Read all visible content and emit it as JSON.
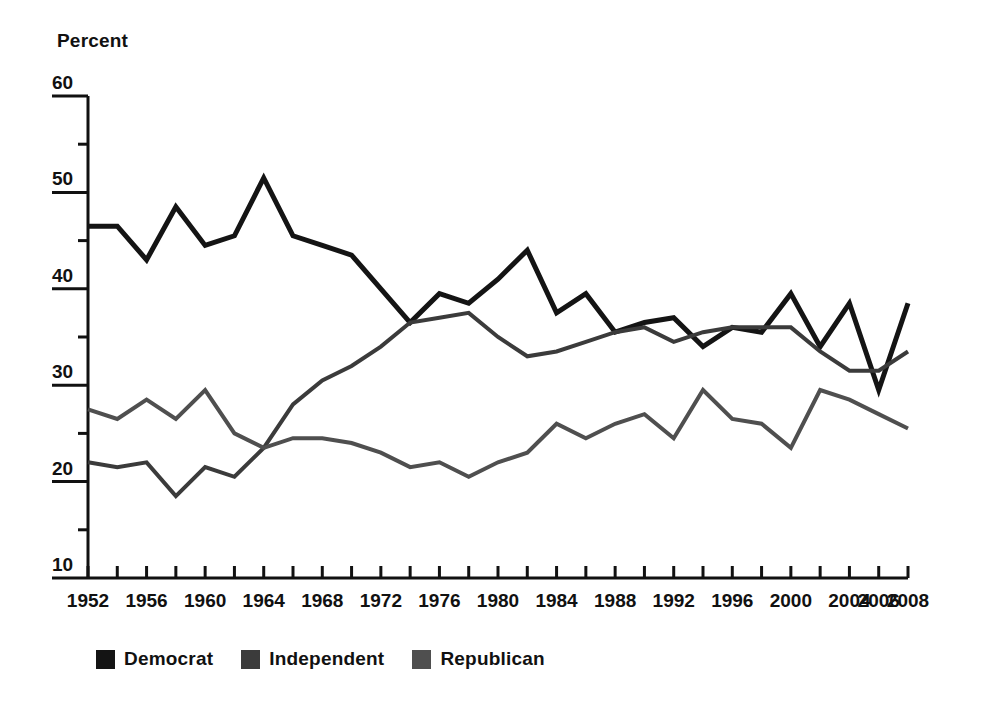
{
  "chart_data": {
    "type": "line",
    "title": "",
    "subtitle": "",
    "xlabel": "",
    "ylabel": "Percent",
    "ylim": [
      10,
      60
    ],
    "xlim": [
      1952,
      2008
    ],
    "grid": false,
    "legend_position": "bottom-left",
    "y_ticks": [
      60,
      50,
      40,
      30,
      20,
      10
    ],
    "y_minor_tick_step": 5,
    "x_ticks": [
      1952,
      1954,
      1956,
      1958,
      1960,
      1962,
      1964,
      1966,
      1968,
      1970,
      1972,
      1974,
      1976,
      1978,
      1980,
      1982,
      1984,
      1986,
      1988,
      1990,
      1992,
      1994,
      1996,
      1998,
      2000,
      2002,
      2004,
      2006,
      2008
    ],
    "x_tick_labels": [
      "1952",
      "1956",
      "1960",
      "1964",
      "1968",
      "1972",
      "1976",
      "1980",
      "1984",
      "1988",
      "1992",
      "1996",
      "2000",
      "2004",
      "2006",
      "2008"
    ],
    "x_tick_label_years": [
      1952,
      1956,
      1960,
      1964,
      1968,
      1972,
      1976,
      1980,
      1984,
      1988,
      1992,
      1996,
      2000,
      2004,
      2006,
      2008
    ],
    "x": [
      1952,
      1954,
      1956,
      1958,
      1960,
      1962,
      1964,
      1966,
      1968,
      1970,
      1972,
      1974,
      1976,
      1978,
      1980,
      1982,
      1984,
      1986,
      1988,
      1990,
      1992,
      1994,
      1996,
      1998,
      2000,
      2002,
      2004,
      2006,
      2008
    ],
    "series": [
      {
        "name": "Democrat",
        "color": "#141414",
        "values": [
          46.5,
          46.5,
          43.0,
          48.5,
          44.5,
          45.5,
          51.5,
          45.5,
          44.5,
          43.5,
          40.0,
          36.5,
          39.5,
          38.5,
          41.0,
          44.0,
          37.5,
          39.5,
          35.5,
          36.5,
          37.0,
          34.0,
          36.0,
          35.5,
          39.5,
          34.0,
          38.5,
          29.5,
          38.5
        ]
      },
      {
        "name": "Independent",
        "color": "#3b3b3b",
        "values": [
          22.0,
          21.5,
          22.0,
          18.5,
          21.5,
          20.5,
          23.5,
          28.0,
          30.5,
          32.0,
          34.0,
          36.5,
          37.0,
          37.5,
          35.0,
          33.0,
          33.5,
          34.5,
          35.5,
          36.0,
          34.5,
          35.5,
          36.0,
          36.0,
          36.0,
          33.5,
          31.5,
          31.5,
          33.5
        ]
      },
      {
        "name": "Republican",
        "color": "#4f4f4f",
        "values": [
          27.5,
          26.5,
          28.5,
          26.5,
          29.5,
          25.0,
          23.5,
          24.5,
          24.5,
          24.0,
          23.0,
          21.5,
          22.0,
          20.5,
          22.0,
          23.0,
          26.0,
          24.5,
          26.0,
          27.0,
          24.5,
          29.5,
          26.5,
          26.0,
          23.5,
          29.5,
          28.5,
          27.0,
          25.5
        ]
      }
    ]
  },
  "axis": {
    "y_title": "Percent"
  },
  "legend": {
    "items": [
      {
        "label": "Democrat",
        "color": "#141414"
      },
      {
        "label": "Independent",
        "color": "#3b3b3b"
      },
      {
        "label": "Republican",
        "color": "#4f4f4f"
      }
    ]
  }
}
